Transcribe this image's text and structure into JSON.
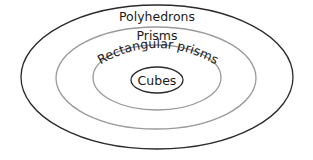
{
  "diagram": {
    "type": "nested-euler-diagram",
    "sets": [
      {
        "label": "Polyhedrons",
        "level": 0
      },
      {
        "label": "Prisms",
        "level": 1
      },
      {
        "label": "Rectangular prisms",
        "level": 2
      },
      {
        "label": "Cubes",
        "level": 3
      }
    ],
    "colors": {
      "outer_stroke": "#2a2a2a",
      "middle_stroke": "#9a9a9a",
      "inner_stroke": "#2a2a2a",
      "text": "#1a1a1a",
      "background": "#ffffff"
    }
  }
}
